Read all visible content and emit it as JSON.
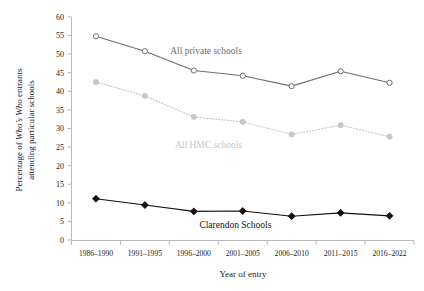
{
  "chart_data": {
    "type": "line",
    "title": "",
    "xlabel": "Year of entry",
    "ylabel_line1": "Percentage of Who’s Who entrants",
    "ylabel_line2": "attending particular schools",
    "categories": [
      "1986–1990",
      "1991–1995",
      "1996–2000",
      "2001–2005",
      "2006–2010",
      "2011–2015",
      "2016–2022"
    ],
    "ylim": [
      0,
      60
    ],
    "yticks": [
      0,
      5,
      10,
      15,
      20,
      25,
      30,
      35,
      40,
      45,
      50,
      55,
      60
    ],
    "ytick_labels": [
      "0",
      "5",
      "10",
      "15",
      "20",
      "25",
      "30",
      "35",
      "40",
      "45",
      "50",
      "55",
      "60"
    ],
    "grid": false,
    "legend": "inline-annotations",
    "series": [
      {
        "name": "All private schools",
        "label": "All private schools",
        "color": "#6e6e6e",
        "marker": "open-circle",
        "linestyle": "solid",
        "values": [
          54.8,
          50.8,
          45.6,
          44.2,
          41.4,
          45.4,
          42.3
        ]
      },
      {
        "name": "All HMC schools",
        "label": "All HMC schools",
        "color": "#c6c6c6",
        "marker": "filled-circle",
        "linestyle": "dotted",
        "values": [
          42.5,
          38.8,
          33.1,
          31.8,
          28.4,
          30.9,
          27.8
        ]
      },
      {
        "name": "Clarendon Schools",
        "label": "Clarendon Schools",
        "color": "#111111",
        "marker": "filled-diamond",
        "linestyle": "solid",
        "values": [
          11.1,
          9.4,
          7.7,
          7.8,
          6.4,
          7.3,
          6.5
        ]
      }
    ],
    "annotations": [
      {
        "text": "All private schools",
        "x": 2.25,
        "y": 50.0,
        "color": "#6e6e6e"
      },
      {
        "text": "All HMC schools",
        "x": 2.3,
        "y": 24.8,
        "color": "#c6c6c6"
      },
      {
        "text": "Clarendon Schools",
        "x": 2.85,
        "y": 3.3,
        "color": "#111111"
      }
    ]
  }
}
